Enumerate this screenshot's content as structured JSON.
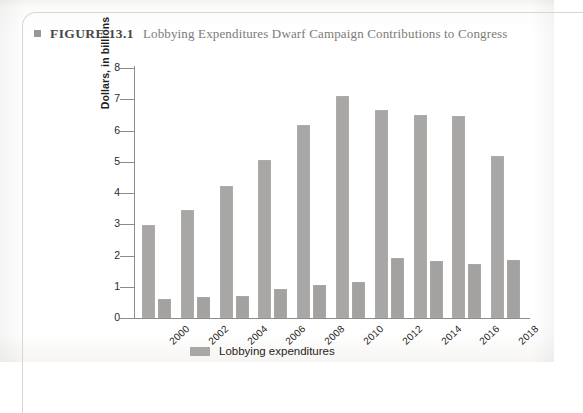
{
  "figure": {
    "bullet_icon": "square-bullet-icon",
    "label": "FIGURE 13.1",
    "title": "Lobbying Expenditures Dwarf Campaign Contributions to Congress"
  },
  "colors": {
    "bar_lobbying": "#a8a7a5",
    "bar_campaign": "#a3a2a0",
    "axis": "#8e8c89",
    "text": "#1f1d1c",
    "title_text": "#7d7b78"
  },
  "legend": {
    "position": "bottom-center",
    "entries": [
      {
        "label": "Lobbying expenditures",
        "color": "#a8a7a5"
      }
    ]
  },
  "chart_data": {
    "type": "bar",
    "title": "Lobbying Expenditures Dwarf Campaign Contributions to Congress",
    "xlabel": "",
    "ylabel": "Dollars, in billions",
    "ylim": [
      0,
      8
    ],
    "yticks": [
      0,
      1,
      2,
      3,
      4,
      5,
      6,
      7,
      8
    ],
    "ytick_labels": [
      "0",
      "1",
      "2",
      "3",
      "4",
      "5",
      "6",
      "7",
      "8"
    ],
    "grid": false,
    "categories": [
      "2000",
      "2002",
      "2004",
      "2006",
      "2008",
      "2010",
      "2012",
      "2014",
      "2016",
      "2018"
    ],
    "series": [
      {
        "name": "Lobbying expenditures",
        "color": "#a8a7a5",
        "values": [
          2.98,
          3.45,
          4.22,
          5.05,
          6.18,
          7.12,
          6.65,
          6.5,
          6.45,
          5.2
        ]
      },
      {
        "name": "Campaign contributions",
        "color": "#a3a2a0",
        "values": [
          0.62,
          0.66,
          0.72,
          0.92,
          1.06,
          1.15,
          1.92,
          1.82,
          1.72,
          1.85
        ]
      }
    ]
  }
}
